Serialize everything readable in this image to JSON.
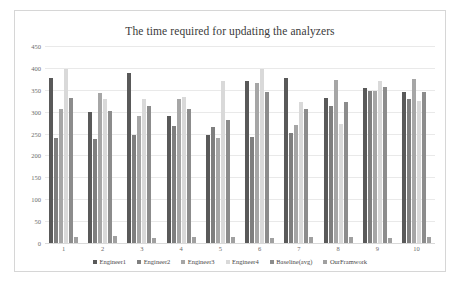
{
  "chart_data": {
    "type": "bar",
    "title": "The time required for updating the analyzers",
    "xlabel": "",
    "ylabel": "",
    "ylim": [
      0,
      450
    ],
    "yticks": [
      0,
      50,
      100,
      150,
      200,
      250,
      300,
      350,
      400,
      450
    ],
    "grid": true,
    "legend_position": "bottom",
    "categories": [
      "1",
      "2",
      "3",
      "4",
      "5",
      "6",
      "7",
      "8",
      "9",
      "10"
    ],
    "series": [
      {
        "name": "Engineer1",
        "color": "#595959",
        "values": [
          378,
          300,
          388,
          290,
          247,
          370,
          378,
          331,
          353,
          345
        ]
      },
      {
        "name": "Engineer2",
        "color": "#7f7f7f",
        "values": [
          240,
          237,
          247,
          268,
          265,
          242,
          252,
          312,
          348,
          330
        ]
      },
      {
        "name": "Engineer3",
        "color": "#a6a6a6",
        "values": [
          305,
          342,
          290,
          328,
          239,
          366,
          270,
          372,
          348,
          375
        ]
      },
      {
        "name": "Engineer4",
        "color": "#d9d9d9",
        "values": [
          398,
          328,
          330,
          334,
          370,
          398,
          322,
          273,
          370,
          325
        ]
      },
      {
        "name": "Baseline(avg)",
        "color": "#8c8c8c",
        "values": [
          332,
          302,
          313,
          305,
          280,
          345,
          305,
          322,
          356,
          344
        ]
      },
      {
        "name": "OurFramwork",
        "color": "#a0a0a0",
        "values": [
          13,
          15,
          12,
          14,
          13,
          12,
          14,
          13,
          12,
          14
        ]
      }
    ]
  }
}
